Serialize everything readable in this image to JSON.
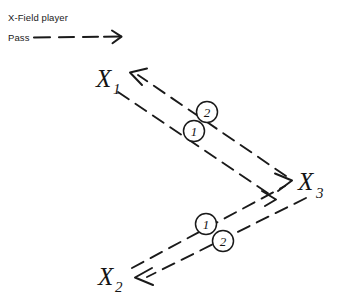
{
  "diagram": {
    "background_color": "#ffffff",
    "ink_color": "#1a1a1a",
    "legend": {
      "line1": "X-Field player",
      "line2": "Pass",
      "symbol_name": "dashed-arrow"
    },
    "players": [
      {
        "id": "x1",
        "label": "X",
        "subscript": "1",
        "x": 110,
        "y": 84
      },
      {
        "id": "x2",
        "label": "X",
        "subscript": "2",
        "x": 112,
        "y": 283
      },
      {
        "id": "x3",
        "label": "X",
        "subscript": "3",
        "x": 305,
        "y": 190
      }
    ],
    "passes": [
      {
        "id": "pass-x3-to-x1",
        "from": "X3",
        "to": "X1",
        "sequence": "2",
        "style": "dashed",
        "arrow_at": "X1"
      },
      {
        "id": "pass-x1-to-x3",
        "from": "X1",
        "to": "X3",
        "sequence": "1",
        "style": "dashed",
        "arrow_at": "X3"
      },
      {
        "id": "pass-x2-to-x3",
        "from": "X2",
        "to": "X3",
        "sequence": "1",
        "style": "dashed",
        "arrow_at": "X3"
      },
      {
        "id": "pass-x3-to-x2",
        "from": "X3",
        "to": "X2",
        "sequence": "2",
        "style": "dashed",
        "arrow_at": "X2"
      }
    ],
    "sequence_markers": [
      {
        "id": "marker-upper-2",
        "value": "2",
        "cx": 207,
        "cy": 112
      },
      {
        "id": "marker-upper-1",
        "value": "1",
        "cx": 194,
        "cy": 131
      },
      {
        "id": "marker-lower-1",
        "value": "1",
        "cx": 206,
        "cy": 224
      },
      {
        "id": "marker-lower-2",
        "value": "2",
        "cx": 223,
        "cy": 241
      }
    ]
  }
}
